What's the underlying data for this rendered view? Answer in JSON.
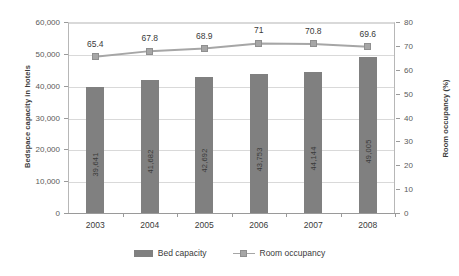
{
  "chart_data": {
    "type": "bar",
    "title": "",
    "categories": [
      "2003",
      "2004",
      "2005",
      "2006",
      "2007",
      "2008"
    ],
    "xlabel": "",
    "ylabel": "Bedspace capacity in hotels",
    "y2label": "Room occupancy (%)",
    "ylim": [
      0,
      60000
    ],
    "y2lim": [
      0,
      80
    ],
    "grid": true,
    "legend_position": "bottom",
    "series": [
      {
        "name": "Bed capacity",
        "type": "bar",
        "axis": "left",
        "color": "#808080",
        "values": [
          39641,
          41682,
          42692,
          43753,
          44144,
          49005
        ],
        "value_labels": [
          "39,641",
          "41,682",
          "42,692",
          "43,753",
          "44,144",
          "49,005"
        ]
      },
      {
        "name": "Room occupancy",
        "type": "line",
        "axis": "right",
        "color": "#a6a6a6",
        "values": [
          65.4,
          67.8,
          68.9,
          71,
          70.8,
          69.6
        ],
        "value_labels": [
          "65.4",
          "67.8",
          "68.9",
          "71",
          "70.8",
          "69.6"
        ]
      }
    ],
    "y_ticks": [
      "0",
      "10,000",
      "20,000",
      "30,000",
      "40,000",
      "50,000",
      "60,000"
    ],
    "y2_ticks": [
      "0",
      "10",
      "20",
      "30",
      "40",
      "50",
      "60",
      "70",
      "80"
    ]
  },
  "legend": [
    {
      "label": "Bed capacity",
      "marker": "bar-swatch"
    },
    {
      "label": "Room occupancy",
      "marker": "line-square-swatch"
    }
  ]
}
